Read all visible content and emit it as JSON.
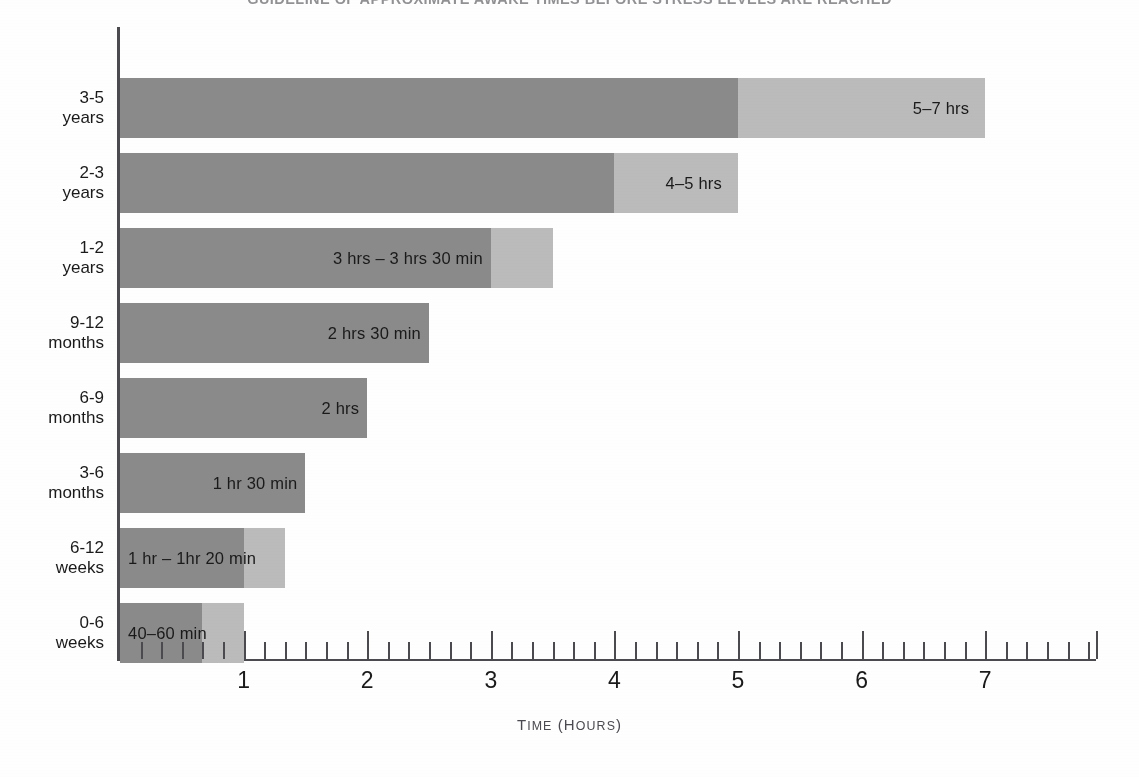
{
  "chart_data": {
    "type": "bar",
    "orientation": "horizontal",
    "title": "GUIDELINE OF APPROXIMATE AWAKE TIMES BEFORE STRESS LEVELS ARE REACHED",
    "xlabel": "Time (hours)",
    "xlabel_main": "T",
    "xlabel_rest": "IME",
    "xlabel_paren_open": " (",
    "xlabel_h": "H",
    "xlabel_ours": "OURS",
    "xlabel_paren_close": ")",
    "ylabel": "",
    "xlim": [
      0,
      7.9
    ],
    "grid": false,
    "legend": null,
    "stacked": true,
    "series": [
      {
        "name": "minimum awake time",
        "color": "#8b8b8b"
      },
      {
        "name": "range extension to maximum",
        "color": "#bcbcbc"
      }
    ],
    "categories": [
      "3-5 years",
      "2-3 years",
      "1-2 years",
      "9-12 months",
      "6-9 months",
      "3-6 months",
      "6-12 weeks",
      "0-6 weeks"
    ],
    "bars": [
      {
        "category_line1": "3-5",
        "category_line2": "years",
        "min_hours": 5,
        "max_hours": 7,
        "label": "5–7 hrs",
        "label_position": "light-segment"
      },
      {
        "category_line1": "2-3",
        "category_line2": "years",
        "min_hours": 4,
        "max_hours": 5,
        "label": "4–5 hrs",
        "label_position": "light-segment"
      },
      {
        "category_line1": "1-2",
        "category_line2": "years",
        "min_hours": 3,
        "max_hours": 3.5,
        "label": "3 hrs – 3 hrs 30 min",
        "label_position": "dark-segment-right"
      },
      {
        "category_line1": "9-12",
        "category_line2": "months",
        "min_hours": 2.5,
        "max_hours": 2.5,
        "label": "2 hrs 30 min",
        "label_position": "dark-segment-right"
      },
      {
        "category_line1": "6-9",
        "category_line2": "months",
        "min_hours": 2,
        "max_hours": 2,
        "label": "2 hrs",
        "label_position": "dark-segment-right"
      },
      {
        "category_line1": "3-6",
        "category_line2": "months",
        "min_hours": 1.5,
        "max_hours": 1.5,
        "label": "1 hr 30 min",
        "label_position": "dark-segment-right"
      },
      {
        "category_line1": "6-12",
        "category_line2": "weeks",
        "min_hours": 1,
        "max_hours": 1.3333,
        "label": "1 hr – 1hr 20 min",
        "label_position": "dark-segment-left"
      },
      {
        "category_line1": "0-6",
        "category_line2": "weeks",
        "min_hours": 0.6667,
        "max_hours": 1,
        "label": "40–60 min",
        "label_position": "dark-segment-left"
      }
    ],
    "x_major_ticks": [
      1,
      2,
      3,
      4,
      5,
      6,
      7
    ],
    "x_major_tick_labels": [
      "1",
      "2",
      "3",
      "4",
      "5",
      "6",
      "7"
    ],
    "x_minor_tick_interval_hours": 0.16667,
    "x_minor_tick_note": "minor tick every 10 minutes"
  },
  "colors": {
    "bar_dark": "#8b8b8b",
    "bar_light": "#bcbcbc",
    "axis": "#4a4a4f",
    "text": "#1a1a1a",
    "background": "#ffffff"
  }
}
